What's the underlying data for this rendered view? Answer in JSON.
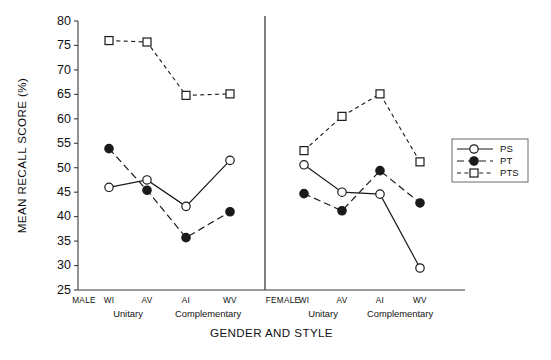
{
  "chart_data": {
    "type": "line",
    "title": "",
    "xlabel": "GENDER AND STYLE",
    "ylabel": "MEAN RECALL SCORE (%)",
    "ylim": [
      25,
      80
    ],
    "yticks": [
      25,
      30,
      35,
      40,
      45,
      50,
      55,
      60,
      65,
      70,
      75,
      80
    ],
    "grid": false,
    "legend_position": "right",
    "panels": [
      {
        "name": "MALE",
        "panel_label": "MALE",
        "categories": [
          "WI",
          "AV",
          "AI",
          "WV"
        ],
        "groups": [
          {
            "label": "Unitary",
            "categories": [
              "WI",
              "AV"
            ]
          },
          {
            "label": "Complementary",
            "categories": [
              "AI",
              "WV"
            ]
          }
        ],
        "series": [
          {
            "name": "PS",
            "values": [
              46.0,
              47.5,
              42.1,
              51.5
            ]
          },
          {
            "name": "PT",
            "values": [
              53.9,
              45.4,
              35.7,
              41.0
            ]
          },
          {
            "name": "PTS",
            "values": [
              76.0,
              75.7,
              64.8,
              65.1
            ]
          }
        ]
      },
      {
        "name": "FEMALE",
        "panel_label": "FEMALE",
        "categories": [
          "WI",
          "AV",
          "AI",
          "WV"
        ],
        "groups": [
          {
            "label": "Unitary",
            "categories": [
              "WI",
              "AV"
            ]
          },
          {
            "label": "Complementary",
            "categories": [
              "AI",
              "WV"
            ]
          }
        ],
        "series": [
          {
            "name": "PS",
            "values": [
              50.6,
              45.0,
              44.6,
              29.5
            ]
          },
          {
            "name": "PT",
            "values": [
              44.7,
              41.2,
              49.4,
              42.8
            ]
          },
          {
            "name": "PTS",
            "values": [
              53.5,
              60.5,
              65.1,
              51.2
            ]
          }
        ]
      }
    ],
    "legend": [
      {
        "label": "PS",
        "marker": "open-circle",
        "line": "solid"
      },
      {
        "label": "PT",
        "marker": "filled-circle",
        "line": "dashed"
      },
      {
        "label": "PTS",
        "marker": "open-square",
        "line": "dotted"
      }
    ],
    "colors": {
      "ink": "#1a1a1a",
      "axis": "#3b3b3b",
      "background": "#ffffff"
    }
  }
}
